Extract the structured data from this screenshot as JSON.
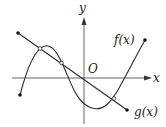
{
  "diagram": {
    "axes": {
      "x_label": "x",
      "y_label": "y",
      "origin_label": "O"
    },
    "curves": [
      {
        "name": "f(x)",
        "type": "cubic",
        "label": "f(x)"
      },
      {
        "name": "g(x)",
        "type": "line",
        "label": "g(x)"
      }
    ],
    "intersections": 3,
    "colors": {
      "stroke": "#2a2a2a",
      "background": "#ffffff"
    }
  }
}
